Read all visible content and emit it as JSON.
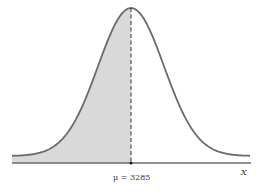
{
  "chart_data": {
    "type": "area",
    "title": "",
    "distribution": "normal",
    "mean": 3285,
    "mean_label": "μ = 3285",
    "xlabel": "X",
    "ylabel": "",
    "shaded_region": {
      "from": "-infinity",
      "to": 3285,
      "area_fraction": 0.5
    },
    "mean_line": {
      "style": "dashed",
      "x": 3285
    },
    "grid": false,
    "legend": null,
    "colors": {
      "curve": "#6b6b6b",
      "shade": "#d9d9d9",
      "axis": "#6b6b6b",
      "mean_line": "#333333"
    }
  },
  "labels": {
    "mean": "μ = 3285",
    "axis": "X"
  }
}
